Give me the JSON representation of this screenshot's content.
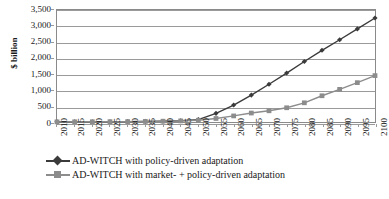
{
  "chart_data": {
    "type": "line",
    "title": "",
    "xlabel": "",
    "ylabel": "$ billion",
    "ylim": [
      0,
      3500
    ],
    "ytick_step": 500,
    "grid": true,
    "legend_position": "bottom",
    "categories": [
      "2010",
      "2015",
      "2020",
      "2025",
      "2030",
      "2035",
      "2040",
      "2045",
      "2050",
      "2055",
      "2060",
      "2065",
      "2070",
      "2075",
      "2080",
      "2085",
      "2090",
      "2095",
      "2100"
    ],
    "ytick_labels": [
      "0",
      "500",
      "1,000",
      "1,500",
      "2,000",
      "2,500",
      "3,000",
      "3,500"
    ],
    "ytick_values": [
      0,
      500,
      1000,
      1500,
      2000,
      2500,
      3000,
      3500
    ],
    "series": [
      {
        "name": "AD-WITCH with policy-driven adaptation",
        "marker": "diamond",
        "color": "#3b3b3b",
        "values": [
          5,
          6,
          8,
          10,
          13,
          18,
          25,
          40,
          75,
          270,
          530,
          840,
          1180,
          1530,
          1890,
          2240,
          2570,
          2910,
          3250
        ]
      },
      {
        "name": "AD-WITCH with market- + policy-driven adaptation",
        "marker": "square",
        "color": "#8c8c8c",
        "values": [
          5,
          6,
          8,
          10,
          13,
          18,
          25,
          35,
          55,
          110,
          190,
          280,
          350,
          445,
          600,
          820,
          1020,
          1230,
          1450
        ]
      }
    ]
  },
  "axis": {
    "y_title": "$ billion"
  },
  "legend": {
    "entries": [
      {
        "label": "AD-WITCH with policy-driven adaptation"
      },
      {
        "label": "AD-WITCH with market- + policy-driven adaptation"
      }
    ]
  },
  "caption": {
    "text": ""
  },
  "colors": {
    "series1": "#3b3b3b",
    "series2": "#8c8c8c",
    "gridline": "#9a9a9a",
    "border": "#8a8a8a",
    "text": "#1a1a1a"
  }
}
